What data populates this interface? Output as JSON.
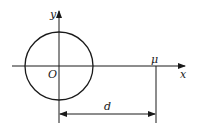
{
  "diagram": {
    "labels": {
      "y_axis": "y",
      "x_axis": "x",
      "origin": "O",
      "point": "μ",
      "distance": "d"
    },
    "colors": {
      "stroke": "#1a1a1a",
      "background": "#ffffff"
    },
    "geometry": {
      "circle_center": [
        59,
        66
      ],
      "circle_radius": 34,
      "point_x": 156,
      "dimension_y": 114
    }
  }
}
